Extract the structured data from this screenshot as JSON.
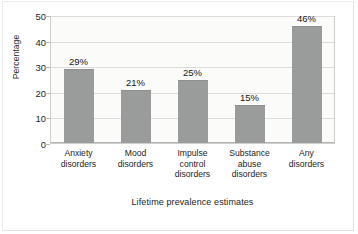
{
  "chart_data": {
    "type": "bar",
    "title": "",
    "subtitle": "",
    "xlabel": "Lifetime prevalence estimates",
    "ylabel": "Percentage",
    "categories": [
      "Anxiety disorders",
      "Mood disorders",
      "Impulse control disorders",
      "Substance abuse disorders",
      "Any disorders"
    ],
    "category_lines": [
      [
        "Anxiety",
        "disorders"
      ],
      [
        "Mood",
        "disorders"
      ],
      [
        "Impulse",
        "control",
        "disorders"
      ],
      [
        "Substance",
        "abuse",
        "disorders"
      ],
      [
        "Any",
        "disorders"
      ]
    ],
    "values": [
      29,
      21,
      25,
      15,
      46
    ],
    "data_labels": [
      "29%",
      "21%",
      "25%",
      "15%",
      "46%"
    ],
    "ylim": [
      0,
      50
    ],
    "yticks": [
      0,
      10,
      20,
      30,
      40,
      50
    ],
    "ytick_labels": [
      "0",
      "10",
      "20",
      "30",
      "40",
      "50"
    ],
    "grid": true,
    "grid_axis": "y",
    "legend": false,
    "legend_position": "none",
    "bar_color": "#9a9b9b",
    "plot_background": "#fbfbfa",
    "gridline_color": "#dcdcdc",
    "axis_color": "#cfcfcf",
    "text_color": "#1c1c1c"
  }
}
